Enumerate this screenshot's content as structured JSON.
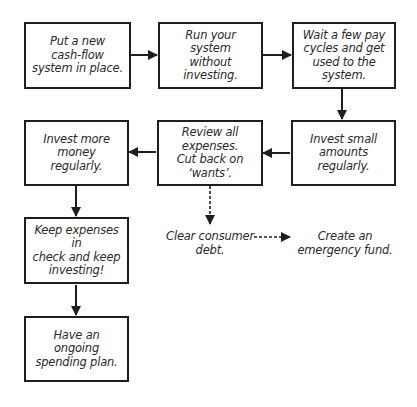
{
  "diagram": {
    "type": "flowchart",
    "nodes": [
      {
        "id": "n1",
        "text": "Put a new cash-flow system in place.",
        "shape": "box"
      },
      {
        "id": "n2",
        "text": "Run your system without investing.",
        "shape": "box"
      },
      {
        "id": "n3",
        "text": "Wait a few pay cycles and get used to the system.",
        "shape": "box"
      },
      {
        "id": "n4",
        "text": "Invest small amounts regularly.",
        "shape": "box"
      },
      {
        "id": "n5",
        "text": "Review all expenses. Cut back on ‘wants’.",
        "shape": "box"
      },
      {
        "id": "n6",
        "text": "Invest more money regularly.",
        "shape": "box"
      },
      {
        "id": "n7",
        "text": "Keep expenses in check and keep investing!",
        "shape": "box"
      },
      {
        "id": "n8",
        "text": "Have an ongoing spending plan.",
        "shape": "box"
      },
      {
        "id": "n9",
        "text": "Clear consumer debt.",
        "shape": "text"
      },
      {
        "id": "n10",
        "text": "Create an emergency fund.",
        "shape": "text"
      }
    ],
    "edges": [
      {
        "from": "n1",
        "to": "n2",
        "style": "solid"
      },
      {
        "from": "n2",
        "to": "n3",
        "style": "solid"
      },
      {
        "from": "n3",
        "to": "n4",
        "style": "solid"
      },
      {
        "from": "n4",
        "to": "n5",
        "style": "solid"
      },
      {
        "from": "n5",
        "to": "n6",
        "style": "solid"
      },
      {
        "from": "n6",
        "to": "n7",
        "style": "solid"
      },
      {
        "from": "n7",
        "to": "n8",
        "style": "solid"
      },
      {
        "from": "n5",
        "to": "n9",
        "style": "dashed"
      },
      {
        "from": "n9",
        "to": "n10",
        "style": "dashed"
      }
    ],
    "labels": {
      "n1": [
        "Put a new",
        "cash-flow",
        "system in place."
      ],
      "n2": [
        "Run your",
        "system",
        "without",
        "investing."
      ],
      "n3": [
        "Wait a few pay",
        "cycles and get",
        "used to the",
        "system."
      ],
      "n4": [
        "Invest small",
        "amounts",
        "regularly."
      ],
      "n5": [
        "Review all",
        "expenses.",
        "Cut back on",
        "‘wants’."
      ],
      "n6": [
        "Invest more",
        "money regularly."
      ],
      "n7": [
        "Keep expenses in",
        "check and keep",
        "investing!"
      ],
      "n8": [
        "Have an ongoing",
        "spending plan."
      ],
      "n9": [
        "Clear consumer",
        "debt."
      ],
      "n10": [
        "Create an",
        "emergency fund."
      ]
    },
    "colors": {
      "stroke": "#1e1e1e",
      "text": "#2a2a2a",
      "background": "#ffffff"
    }
  }
}
